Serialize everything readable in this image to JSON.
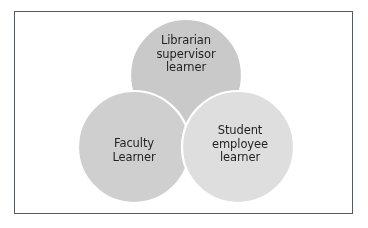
{
  "diagram": {
    "type": "venn",
    "title": "",
    "frame": {
      "border_color": "#555a5e",
      "background_color": "#ffffff"
    },
    "circle_colors": {
      "top": "#c9c9c9",
      "left": "#cfcfcf",
      "right": "#dedede",
      "separator_stroke": "#ffffff",
      "text": "#231f20"
    },
    "sets": [
      {
        "id": "librarian",
        "position": "top",
        "fill": "#c9c9c9",
        "lines": [
          "Librarian",
          "supervisor",
          "learner"
        ],
        "label": "Librarian supervisor learner"
      },
      {
        "id": "faculty",
        "position": "bottom-left",
        "fill": "#cfcfcf",
        "lines": [
          "Faculty",
          "Learner"
        ],
        "label": "Faculty Learner"
      },
      {
        "id": "student",
        "position": "bottom-right",
        "fill": "#dedede",
        "lines": [
          "Student",
          "employee",
          "learner"
        ],
        "label": "Student employee learner"
      }
    ]
  }
}
